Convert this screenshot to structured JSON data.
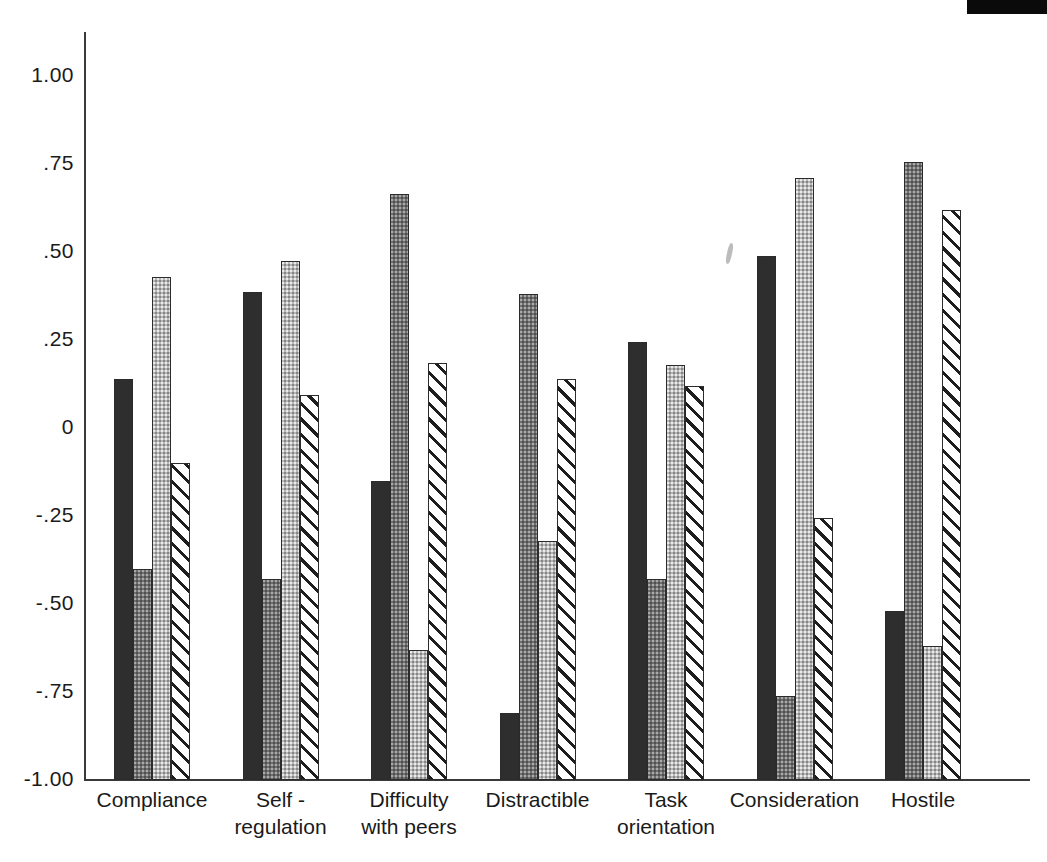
{
  "chart_data": {
    "type": "bar",
    "title": "",
    "xlabel": "",
    "ylabel": "",
    "ylim": [
      -1.0,
      1.0
    ],
    "grid": false,
    "legend_position": "none",
    "baseline": -1.0,
    "y_ticks": [
      {
        "value": 1.0,
        "label": "1.00"
      },
      {
        "value": 0.75,
        "label": ".75"
      },
      {
        "value": 0.5,
        "label": ".50"
      },
      {
        "value": 0.25,
        "label": ".25"
      },
      {
        "value": 0.0,
        "label": "0"
      },
      {
        "value": -0.25,
        "label": "-.25"
      },
      {
        "value": -0.5,
        "label": "-.50"
      },
      {
        "value": -0.75,
        "label": "-.75"
      },
      {
        "value": -1.0,
        "label": "-1.00"
      }
    ],
    "categories": [
      "Compliance",
      "Self -\nregulation",
      "Difficulty\nwith peers",
      "Distractible",
      "Task\norientation",
      "Consideration",
      "Hostile"
    ],
    "series": [
      {
        "name": "series-1",
        "fill": "solid-dark",
        "color": "#2e2e2e",
        "values": [
          0.14,
          0.385,
          -0.15,
          -0.81,
          0.245,
          0.49,
          -0.52
        ]
      },
      {
        "name": "series-2",
        "fill": "dotted-gray",
        "color": "#6f6f6f",
        "values": [
          -0.4,
          -0.43,
          0.665,
          0.38,
          -0.43,
          -0.76,
          0.755
        ]
      },
      {
        "name": "series-3",
        "fill": "light-gray",
        "color": "#b7b7b7",
        "values": [
          0.43,
          0.475,
          -0.63,
          -0.32,
          0.18,
          0.71,
          -0.62
        ]
      },
      {
        "name": "series-4",
        "fill": "diagonal-hatch",
        "color": "#ffffff",
        "values": [
          -0.1,
          0.095,
          0.185,
          0.14,
          0.12,
          -0.255,
          0.62
        ]
      }
    ]
  }
}
